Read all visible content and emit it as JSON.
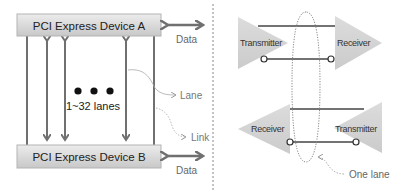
{
  "left_panel": {
    "device_a": {
      "label": "PCI Express Device A"
    },
    "device_b": {
      "label": "PCI Express Device B"
    },
    "data_top": {
      "label": "Data"
    },
    "data_bottom": {
      "label": "Data"
    },
    "lane_count": {
      "label": "1~32 lanes",
      "dots": "● ● ●"
    },
    "lane_callout": {
      "label": "Lane"
    },
    "link_callout": {
      "label": "Link"
    }
  },
  "right_panel": {
    "top_pair": {
      "transmitter": {
        "label": "Transmitter"
      },
      "receiver": {
        "label": "Receiver"
      }
    },
    "bottom_pair": {
      "receiver": {
        "label": "Receiver"
      },
      "transmitter": {
        "label": "Transmitter"
      }
    },
    "one_lane_callout": {
      "label": "One lane"
    }
  },
  "colors": {
    "box_fill_top": "#eaeaea",
    "box_fill_bottom": "#c9c9c9",
    "box_stroke": "#b0b0b0",
    "arrow": "#707070",
    "triangle_fill": "#d4d4d4",
    "wire": "#444444",
    "text_dark": "#222222",
    "text_label": "#666666",
    "callout": "#9a9a9a"
  }
}
